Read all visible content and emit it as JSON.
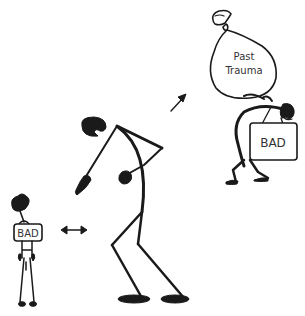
{
  "illustration": {
    "background": "#ffffff",
    "ink_color": "#1a1a1a",
    "figures": [
      {
        "id": "small-child-figure",
        "bag_label": "BAD"
      },
      {
        "id": "bent-adult-figure"
      },
      {
        "id": "burdened-figure",
        "sack_label_line1": "Past",
        "sack_label_line2": "Trauma",
        "suitcase_label": "BAD"
      }
    ],
    "arrows": [
      {
        "id": "double-arrow",
        "direction": "left-right"
      },
      {
        "id": "diagonal-arrow",
        "direction": "up-right"
      }
    ]
  }
}
